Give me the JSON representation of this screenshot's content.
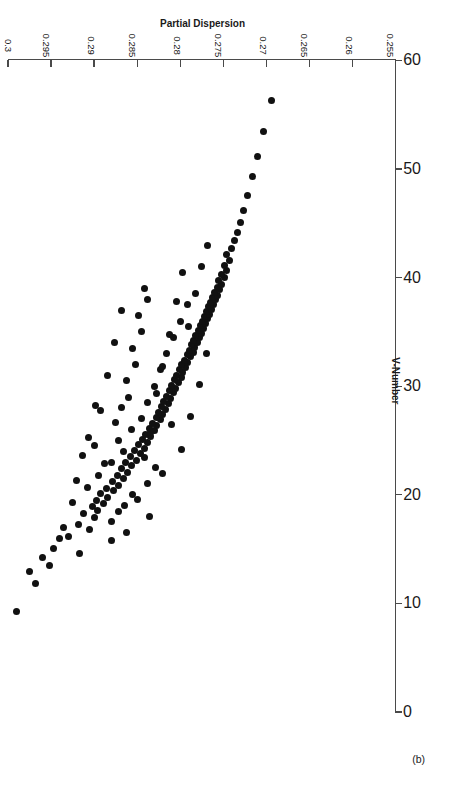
{
  "figure": {
    "panel_label": "(b)",
    "background_color": "#ffffff",
    "marker_color": "#111111",
    "axis_color": "#4a4a4a"
  },
  "chart_data": {
    "type": "scatter",
    "title": "",
    "subtitle": "",
    "xlabel": "V-Number",
    "ylabel": "Partial Dispersion",
    "xlim": [
      0,
      60
    ],
    "ylim": [
      0.255,
      0.3
    ],
    "xticks": [
      0,
      10,
      20,
      30,
      40,
      50,
      60
    ],
    "xtick_labels": [
      "0",
      "10",
      "20",
      "30",
      "40",
      "50",
      "60"
    ],
    "yticks": [
      0.255,
      0.26,
      0.265,
      0.27,
      0.275,
      0.28,
      0.285,
      0.29,
      0.295,
      0.3
    ],
    "ytick_labels": [
      "0.255",
      "0.26",
      "0.265",
      "0.27",
      "0.275",
      "0.28",
      "0.285",
      "0.29",
      "0.295",
      "0.3"
    ],
    "grid": false,
    "legend": null,
    "annotations": [
      "(b)"
    ],
    "marker": "filled-circle",
    "series": [
      {
        "name": "Optical glasses",
        "points": [
          [
            9.3,
            0.299
          ],
          [
            12.9,
            0.2975
          ],
          [
            14.6,
            0.2917
          ],
          [
            15.1,
            0.2947
          ],
          [
            16.2,
            0.293
          ],
          [
            16.8,
            0.2905
          ],
          [
            17.3,
            0.2918
          ],
          [
            17.9,
            0.29
          ],
          [
            18.3,
            0.2912
          ],
          [
            18.6,
            0.2896
          ],
          [
            18.9,
            0.2902
          ],
          [
            19.2,
            0.2889
          ],
          [
            19.5,
            0.2897
          ],
          [
            19.8,
            0.2884
          ],
          [
            20.1,
            0.2893
          ],
          [
            20.4,
            0.2878
          ],
          [
            20.6,
            0.2886
          ],
          [
            20.9,
            0.2872
          ],
          [
            21.2,
            0.2879
          ],
          [
            21.5,
            0.2866
          ],
          [
            21.8,
            0.2873
          ],
          [
            22.1,
            0.2861
          ],
          [
            22.4,
            0.2868
          ],
          [
            22.7,
            0.2856
          ],
          [
            23.0,
            0.2863
          ],
          [
            23.2,
            0.2851
          ],
          [
            23.5,
            0.2858
          ],
          [
            23.8,
            0.2846
          ],
          [
            24.1,
            0.2853
          ],
          [
            24.3,
            0.2842
          ],
          [
            24.6,
            0.2848
          ],
          [
            24.8,
            0.2838
          ],
          [
            25.1,
            0.2844
          ],
          [
            25.4,
            0.2834
          ],
          [
            25.6,
            0.284
          ],
          [
            25.9,
            0.283
          ],
          [
            26.1,
            0.2836
          ],
          [
            26.4,
            0.2827
          ],
          [
            26.6,
            0.2832
          ],
          [
            26.9,
            0.2823
          ],
          [
            27.1,
            0.2828
          ],
          [
            27.4,
            0.282
          ],
          [
            27.6,
            0.2825
          ],
          [
            27.9,
            0.2817
          ],
          [
            28.1,
            0.2822
          ],
          [
            28.4,
            0.2814
          ],
          [
            28.6,
            0.2819
          ],
          [
            28.9,
            0.2811
          ],
          [
            29.1,
            0.2816
          ],
          [
            29.4,
            0.2808
          ],
          [
            29.6,
            0.2813
          ],
          [
            29.8,
            0.2805
          ],
          [
            30.1,
            0.281
          ],
          [
            30.3,
            0.2802
          ],
          [
            30.6,
            0.2807
          ],
          [
            30.8,
            0.2799
          ],
          [
            31.0,
            0.2804
          ],
          [
            31.3,
            0.2797
          ],
          [
            31.5,
            0.2801
          ],
          [
            31.7,
            0.2794
          ],
          [
            32.0,
            0.2798
          ],
          [
            32.2,
            0.2791
          ],
          [
            32.4,
            0.2795
          ],
          [
            32.7,
            0.2788
          ],
          [
            32.9,
            0.2792
          ],
          [
            33.1,
            0.2785
          ],
          [
            33.3,
            0.2789
          ],
          [
            33.6,
            0.2783
          ],
          [
            33.8,
            0.2787
          ],
          [
            34.0,
            0.278
          ],
          [
            34.2,
            0.2784
          ],
          [
            34.5,
            0.2778
          ],
          [
            34.7,
            0.2782
          ],
          [
            34.9,
            0.2775
          ],
          [
            35.1,
            0.2779
          ],
          [
            35.3,
            0.2773
          ],
          [
            35.6,
            0.2777
          ],
          [
            35.8,
            0.2771
          ],
          [
            36.0,
            0.2774
          ],
          [
            36.2,
            0.2768
          ],
          [
            36.4,
            0.2772
          ],
          [
            36.6,
            0.2766
          ],
          [
            36.9,
            0.277
          ],
          [
            37.1,
            0.2764
          ],
          [
            37.3,
            0.2767
          ],
          [
            37.5,
            0.2761
          ],
          [
            37.7,
            0.2765
          ],
          [
            38.0,
            0.2759
          ],
          [
            38.2,
            0.2762
          ],
          [
            38.4,
            0.2757
          ],
          [
            38.6,
            0.276
          ],
          [
            38.9,
            0.2754
          ],
          [
            39.1,
            0.2757
          ],
          [
            39.4,
            0.2752
          ],
          [
            39.7,
            0.2755
          ],
          [
            40.0,
            0.2749
          ],
          [
            40.3,
            0.2752
          ],
          [
            40.7,
            0.2746
          ],
          [
            41.1,
            0.2749
          ],
          [
            41.6,
            0.2743
          ],
          [
            42.1,
            0.2746
          ],
          [
            42.7,
            0.274
          ],
          [
            43.4,
            0.2737
          ],
          [
            44.2,
            0.2734
          ],
          [
            45.1,
            0.273
          ],
          [
            46.2,
            0.2726
          ],
          [
            47.6,
            0.2722
          ],
          [
            49.3,
            0.2716
          ],
          [
            51.2,
            0.271
          ],
          [
            53.5,
            0.2703
          ],
          [
            56.3,
            0.2694
          ],
          [
            21.0,
            0.2838
          ],
          [
            22.5,
            0.2829
          ],
          [
            24.0,
            0.2866
          ],
          [
            26.0,
            0.2856
          ],
          [
            27.0,
            0.2845
          ],
          [
            28.5,
            0.2838
          ],
          [
            30.0,
            0.283
          ],
          [
            31.5,
            0.2823
          ],
          [
            33.0,
            0.2816
          ],
          [
            34.5,
            0.2808
          ],
          [
            36.0,
            0.28
          ],
          [
            37.5,
            0.2792
          ],
          [
            19.0,
            0.2865
          ],
          [
            20.0,
            0.2855
          ],
          [
            23.0,
            0.288
          ],
          [
            25.0,
            0.2872
          ],
          [
            29.0,
            0.286
          ],
          [
            32.0,
            0.2852
          ],
          [
            35.0,
            0.2845
          ],
          [
            38.0,
            0.2838
          ],
          [
            17.5,
            0.288
          ],
          [
            18.5,
            0.2872
          ],
          [
            21.8,
            0.2895
          ],
          [
            22.9,
            0.2888
          ],
          [
            26.7,
            0.2875
          ],
          [
            28.0,
            0.2868
          ],
          [
            30.5,
            0.2862
          ],
          [
            33.5,
            0.2855
          ],
          [
            36.5,
            0.2848
          ],
          [
            39.0,
            0.2842
          ],
          [
            16.5,
            0.2862
          ],
          [
            19.6,
            0.285
          ],
          [
            23.4,
            0.2842
          ],
          [
            25.7,
            0.2835
          ],
          [
            29.3,
            0.2828
          ],
          [
            31.8,
            0.282
          ],
          [
            34.8,
            0.2812
          ],
          [
            37.8,
            0.2804
          ],
          [
            40.5,
            0.2797
          ],
          [
            15.8,
            0.288
          ],
          [
            20.7,
            0.2908
          ],
          [
            24.5,
            0.29
          ],
          [
            27.8,
            0.2892
          ],
          [
            31.0,
            0.2884
          ],
          [
            34.0,
            0.2876
          ],
          [
            37.0,
            0.2868
          ],
          [
            18.0,
            0.2836
          ],
          [
            22.0,
            0.282
          ],
          [
            26.5,
            0.281
          ],
          [
            35.5,
            0.279
          ],
          [
            38.5,
            0.2782
          ],
          [
            41.0,
            0.2775
          ],
          [
            43.0,
            0.2768
          ],
          [
            13.5,
            0.2952
          ],
          [
            11.8,
            0.2968
          ],
          [
            14.2,
            0.296
          ],
          [
            16.0,
            0.294
          ],
          [
            17.0,
            0.2935
          ],
          [
            19.3,
            0.2925
          ],
          [
            21.3,
            0.292
          ],
          [
            23.6,
            0.2913
          ],
          [
            25.3,
            0.2906
          ],
          [
            28.2,
            0.2898
          ],
          [
            33.0,
            0.277
          ],
          [
            30.2,
            0.2778
          ],
          [
            27.2,
            0.2788
          ],
          [
            24.2,
            0.2798
          ]
        ]
      }
    ]
  }
}
